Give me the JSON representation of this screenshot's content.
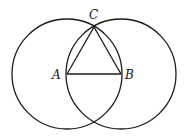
{
  "diagram": {
    "colors": {
      "stroke": "#1a1a1a",
      "background": "#ffffff",
      "text": "#111111"
    },
    "points": {
      "A": {
        "label": "A",
        "x": 67,
        "y": 74
      },
      "B": {
        "label": "B",
        "x": 121,
        "y": 74
      },
      "C": {
        "label": "C",
        "x": 94,
        "y": 27
      }
    },
    "circles": [
      {
        "name": "circle-centered-A",
        "cx": 67,
        "cy": 74,
        "r": 55
      },
      {
        "name": "circle-centered-B",
        "cx": 121,
        "cy": 74,
        "r": 55
      }
    ],
    "segments": [
      {
        "name": "segment-AB",
        "from": "A",
        "to": "B"
      },
      {
        "name": "segment-AC",
        "from": "A",
        "to": "C"
      },
      {
        "name": "segment-BC",
        "from": "B",
        "to": "C"
      }
    ],
    "labels": {
      "A": "A",
      "B": "B",
      "C": "C"
    }
  }
}
